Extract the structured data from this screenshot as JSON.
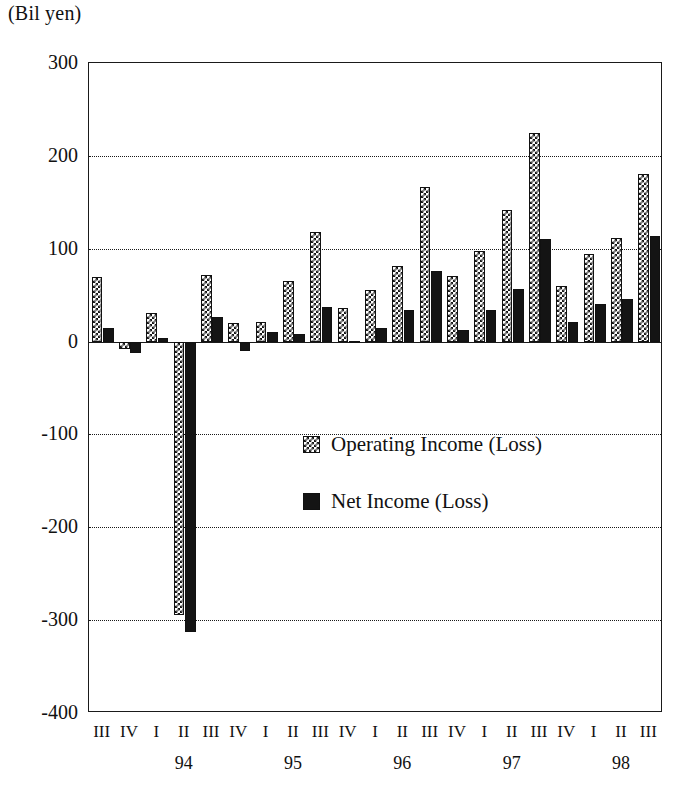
{
  "chart_data": {
    "type": "bar",
    "title": "",
    "units_label": "(Bil yen)",
    "xlabel": "",
    "ylabel": "",
    "ylim": [
      -400,
      300
    ],
    "yticks": [
      300,
      200,
      100,
      0,
      -100,
      -200,
      -300,
      -400
    ],
    "grid": true,
    "legend_position": "center",
    "categories": [
      "III",
      "IV",
      "I",
      "II",
      "III",
      "IV",
      "I",
      "II",
      "III",
      "IV",
      "I",
      "II",
      "III",
      "IV",
      "I",
      "II",
      "III",
      "IV",
      "I",
      "II",
      "III"
    ],
    "year_groups": [
      {
        "label": "94",
        "start_index": 2
      },
      {
        "label": "95",
        "start_index": 6
      },
      {
        "label": "96",
        "start_index": 10
      },
      {
        "label": "97",
        "start_index": 14
      },
      {
        "label": "98",
        "start_index": 18
      }
    ],
    "series": [
      {
        "name": "Operating Income (Loss)",
        "pattern": "checkered",
        "values": [
          70,
          -8,
          31,
          -295,
          72,
          20,
          21,
          65,
          118,
          36,
          56,
          81,
          166,
          71,
          98,
          142,
          225,
          60,
          94,
          112,
          181
        ]
      },
      {
        "name": "Net Income (Loss)",
        "pattern": "solid",
        "values": [
          15,
          -12,
          4,
          -313,
          26,
          -10,
          10,
          8,
          37,
          1,
          15,
          34,
          76,
          12,
          34,
          57,
          111,
          21,
          41,
          46,
          114
        ]
      }
    ]
  },
  "legend": {
    "items": [
      {
        "label": "Operating Income (Loss)"
      },
      {
        "label": "Net Income (Loss)"
      }
    ]
  }
}
